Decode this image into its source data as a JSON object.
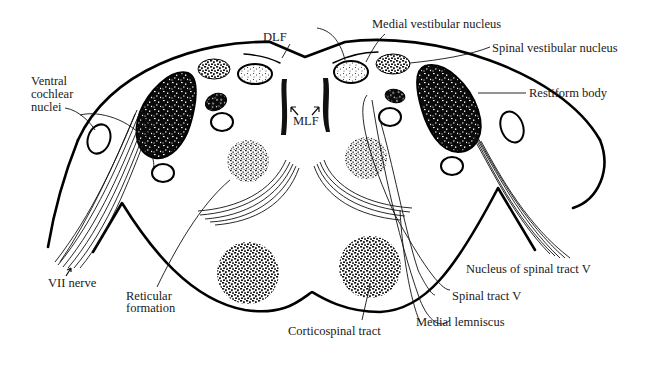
{
  "figure": {
    "colors": {
      "ink": "#000000",
      "background": "#ffffff",
      "label": "#1a1a1a"
    },
    "labels": {
      "dlf": "DLF",
      "medial_vestibular_nucleus": "Medial vestibular nucleus",
      "spinal_vestibular_nucleus": "Spinal vestibular nucleus",
      "restiform_body": "Restiform body",
      "ventral_cochlear_nuclei": [
        "Ventral",
        "cochlear",
        "nuclei"
      ],
      "mlf": "MLF",
      "vii_nerve": "VII nerve",
      "reticular_formation": [
        "Reticular",
        "formation"
      ],
      "corticospinal_tract": "Corticospinal tract",
      "medial_lemniscus": "Medial lemniscus",
      "spinal_tract_v": "Spinal tract V",
      "nucleus_of_spinal_tract_v": "Nucleus of spinal tract V"
    }
  }
}
